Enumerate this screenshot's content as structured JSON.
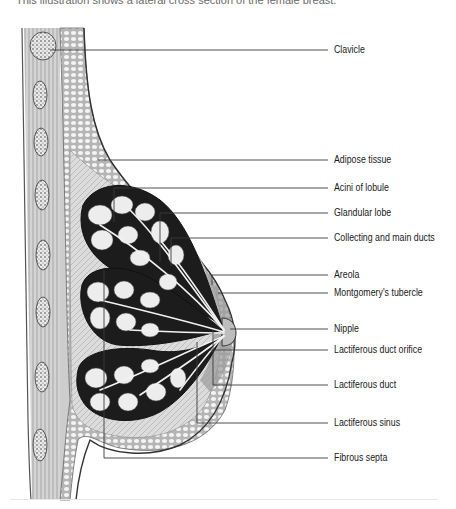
{
  "caption": "This illustration shows a lateral cross section of the female breast.",
  "diagram": {
    "title": "Lateral cross section of the female breast",
    "labels": [
      {
        "id": "clavicle",
        "text": "Clavicle",
        "y": 50
      },
      {
        "id": "adipose-tissue",
        "text": "Adipose tissue",
        "y": 160
      },
      {
        "id": "acini-of-lobule",
        "text": "Acini of lobule",
        "y": 188
      },
      {
        "id": "glandular-lobe",
        "text": "Glandular lobe",
        "y": 213
      },
      {
        "id": "collecting-and-main-ducts",
        "text": "Collecting and main ducts",
        "y": 238
      },
      {
        "id": "areola",
        "text": "Areola",
        "y": 275
      },
      {
        "id": "montgomerys-tubercle",
        "text": "Montgomery's tubercle",
        "y": 293
      },
      {
        "id": "nipple",
        "text": "Nipple",
        "y": 329
      },
      {
        "id": "lactiferous-duct-orifice",
        "text": "Lactiferous duct orifice",
        "y": 350
      },
      {
        "id": "lactiferous-duct",
        "text": "Lactiferous duct",
        "y": 385
      },
      {
        "id": "lactiferous-sinus",
        "text": "Lactiferous sinus",
        "y": 423
      },
      {
        "id": "fibrous-septa",
        "text": "Fibrous septa",
        "y": 458
      }
    ],
    "colors": {
      "ink": "#1a1a1a",
      "tissue_dark": "#1c1c1c",
      "tissue_mid": "#8a8a8a",
      "tissue_light": "#d9d9d9",
      "background": "#ffffff"
    }
  }
}
